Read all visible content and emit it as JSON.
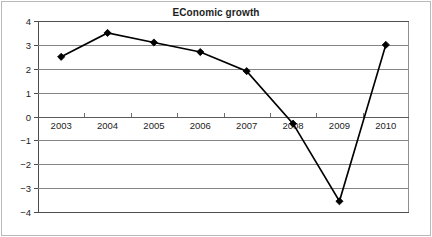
{
  "chart_data": {
    "type": "line",
    "title": "EConomic growth",
    "xlabel": "",
    "ylabel": "",
    "categories": [
      "2003",
      "2004",
      "2005",
      "2006",
      "2007",
      "2008",
      "2009",
      "2010"
    ],
    "values": [
      2.5,
      3.5,
      3.1,
      2.7,
      1.9,
      -0.3,
      -3.55,
      3.0
    ],
    "series": [
      {
        "name": "Economic growth",
        "values": [
          2.5,
          3.5,
          3.1,
          2.7,
          1.9,
          -0.3,
          -3.55,
          3.0
        ],
        "color": "#000000",
        "marker": "diamond",
        "marker_color": "#000000"
      }
    ],
    "ylim": [
      -4,
      4
    ],
    "yticks": [
      4,
      3,
      2,
      1,
      0,
      -1,
      -2,
      -3,
      -4
    ],
    "ytick_labels": [
      "4",
      "3",
      "2",
      "1",
      "0",
      "−1",
      "−2",
      "−3",
      "−4"
    ],
    "grid": true,
    "grid_axis": "y",
    "legend": false,
    "legend_position": "none",
    "xaxis_labels_at_zero": true,
    "gridline_color": "#858585",
    "axis_color": "#4c4c4c",
    "background": "#ffffff"
  }
}
